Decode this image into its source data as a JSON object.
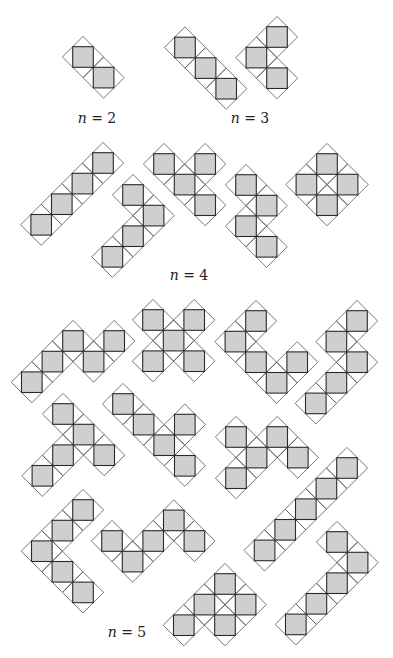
{
  "figure": {
    "step": 20.6,
    "colors": {
      "fill": "#cfcfcf",
      "square_stroke": "#2a2a2a",
      "diamond_stroke": "#555555",
      "background": "#ffffff"
    }
  },
  "labels": [
    {
      "id": "n2",
      "var": "n",
      "text": " = 2",
      "x": 97,
      "y": 118
    },
    {
      "id": "n3",
      "var": "n",
      "text": " = 3",
      "x": 250,
      "y": 118
    },
    {
      "id": "n4",
      "var": "n",
      "text": " = 4",
      "x": 189,
      "y": 275
    },
    {
      "id": "n5",
      "var": "n",
      "text": " = 5",
      "x": 127,
      "y": 632
    }
  ],
  "shapes": [
    {
      "group": "n=2",
      "origin": [
        83,
        57
      ],
      "cells": [
        [
          0,
          0
        ],
        [
          1,
          1
        ]
      ]
    },
    {
      "group": "n=3",
      "origin": [
        185,
        47.5
      ],
      "cells": [
        [
          0,
          0
        ],
        [
          1,
          1
        ],
        [
          2,
          2
        ]
      ]
    },
    {
      "group": "n=3",
      "origin": [
        277,
        37
      ],
      "cells": [
        [
          0,
          0
        ],
        [
          -1,
          1
        ],
        [
          0,
          2
        ]
      ]
    },
    {
      "group": "n=4",
      "origin": [
        103,
        163
      ],
      "cells": [
        [
          0,
          0
        ],
        [
          -1,
          1
        ],
        [
          -2,
          2
        ],
        [
          -3,
          3
        ]
      ]
    },
    {
      "group": "n=4",
      "origin": [
        133,
        195
      ],
      "cells": [
        [
          0,
          0
        ],
        [
          1,
          1
        ],
        [
          0,
          2
        ],
        [
          -1,
          3
        ]
      ]
    },
    {
      "group": "n=4",
      "origin": [
        164,
        164
      ],
      "cells": [
        [
          0,
          0
        ],
        [
          2,
          0
        ],
        [
          1,
          1
        ],
        [
          2,
          2
        ]
      ]
    },
    {
      "group": "n=4",
      "origin": [
        246,
        185
      ],
      "cells": [
        [
          0,
          0
        ],
        [
          1,
          1
        ],
        [
          0,
          2
        ],
        [
          1,
          3
        ]
      ]
    },
    {
      "group": "n=4",
      "origin": [
        327,
        164
      ],
      "cells": [
        [
          0,
          0
        ],
        [
          -1,
          1
        ],
        [
          1,
          1
        ],
        [
          0,
          2
        ]
      ]
    },
    {
      "group": "n=5",
      "origin": [
        73,
        341
      ],
      "cells": [
        [
          0,
          0
        ],
        [
          2,
          0
        ],
        [
          -1,
          1
        ],
        [
          1,
          1
        ],
        [
          -2,
          2
        ]
      ]
    },
    {
      "group": "n=5",
      "origin": [
        153,
        320
      ],
      "cells": [
        [
          0,
          0
        ],
        [
          2,
          0
        ],
        [
          1,
          1
        ],
        [
          0,
          2
        ],
        [
          2,
          2
        ]
      ]
    },
    {
      "group": "n=5",
      "origin": [
        256,
        321
      ],
      "cells": [
        [
          0,
          0
        ],
        [
          -1,
          1
        ],
        [
          0,
          2
        ],
        [
          1,
          3
        ],
        [
          2,
          2
        ]
      ]
    },
    {
      "group": "n=5",
      "origin": [
        357,
        321
      ],
      "cells": [
        [
          0,
          0
        ],
        [
          -1,
          1
        ],
        [
          0,
          2
        ],
        [
          -1,
          3
        ],
        [
          -2,
          4
        ]
      ]
    },
    {
      "group": "n=5",
      "origin": [
        63,
        414
      ],
      "cells": [
        [
          0,
          0
        ],
        [
          1,
          1
        ],
        [
          0,
          2
        ],
        [
          2,
          2
        ],
        [
          -1,
          3
        ]
      ]
    },
    {
      "group": "n=5",
      "origin": [
        123,
        404
      ],
      "cells": [
        [
          0,
          0
        ],
        [
          1,
          1
        ],
        [
          2,
          2
        ],
        [
          3,
          1
        ],
        [
          3,
          3
        ]
      ]
    },
    {
      "group": "n=5",
      "origin": [
        236,
        437
      ],
      "cells": [
        [
          0,
          0
        ],
        [
          2,
          0
        ],
        [
          1,
          1
        ],
        [
          3,
          1
        ],
        [
          0,
          2
        ]
      ]
    },
    {
      "group": "n=5",
      "origin": [
        347,
        468
      ],
      "cells": [
        [
          0,
          0
        ],
        [
          -1,
          1
        ],
        [
          -2,
          2
        ],
        [
          -3,
          3
        ],
        [
          -4,
          4
        ]
      ]
    },
    {
      "group": "n=5",
      "origin": [
        337,
        542
      ],
      "cells": [
        [
          0,
          0
        ],
        [
          1,
          1
        ],
        [
          0,
          2
        ],
        [
          -1,
          3
        ],
        [
          -2,
          4
        ]
      ]
    },
    {
      "group": "n=5",
      "origin": [
        83,
        510
      ],
      "cells": [
        [
          0,
          0
        ],
        [
          -1,
          1
        ],
        [
          -2,
          2
        ],
        [
          -1,
          3
        ],
        [
          0,
          4
        ]
      ]
    },
    {
      "group": "n=5",
      "origin": [
        112,
        541
      ],
      "cells": [
        [
          0,
          0
        ],
        [
          1,
          1
        ],
        [
          2,
          0
        ],
        [
          3,
          -1
        ],
        [
          4,
          0
        ]
      ]
    },
    {
      "group": "n=5",
      "origin": [
        225,
        584
      ],
      "cells": [
        [
          0,
          0
        ],
        [
          -1,
          1
        ],
        [
          1,
          1
        ],
        [
          -2,
          2
        ],
        [
          0,
          2
        ]
      ]
    }
  ]
}
